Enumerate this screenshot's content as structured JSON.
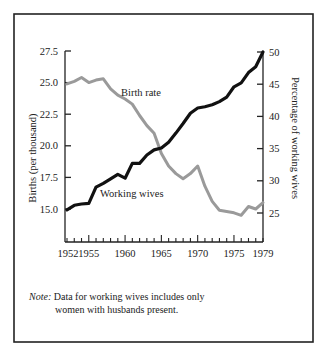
{
  "chart_data": {
    "type": "line",
    "title": "",
    "xlabel": "",
    "ylabel": "Births (per thousand)",
    "y2label": "Percentage of working wives",
    "x": [
      1952,
      1953,
      1954,
      1955,
      1956,
      1957,
      1958,
      1959,
      1960,
      1961,
      1962,
      1963,
      1964,
      1965,
      1966,
      1967,
      1968,
      1969,
      1970,
      1971,
      1972,
      1973,
      1974,
      1975,
      1976,
      1977,
      1978,
      1979
    ],
    "xlim": [
      1952,
      1979
    ],
    "ylim": [
      12.5,
      27.5
    ],
    "y2lim": [
      20,
      50
    ],
    "x_ticks": [
      1952,
      1955,
      1960,
      1965,
      1970,
      1975,
      1979
    ],
    "y_ticks": [
      "15.0",
      "17.5",
      "20.0",
      "22.5",
      "25.0",
      "27.5"
    ],
    "y2_ticks": [
      "25",
      "30",
      "35",
      "40",
      "45",
      "50"
    ],
    "grid": false,
    "series": [
      {
        "name": "Birth rate",
        "axis": "left",
        "color": "#9a9a9a",
        "values": [
          24.9,
          25.1,
          25.4,
          25.0,
          25.2,
          25.3,
          24.5,
          24.0,
          23.7,
          23.3,
          22.4,
          21.6,
          21.0,
          19.4,
          18.4,
          17.8,
          17.4,
          17.8,
          18.4,
          16.8,
          15.6,
          14.9,
          14.8,
          14.7,
          14.5,
          15.2,
          15.0,
          15.5
        ]
      },
      {
        "name": "Working wives",
        "axis": "right",
        "color": "#111111",
        "values": [
          25.5,
          26.2,
          26.4,
          26.5,
          29.0,
          29.6,
          30.3,
          31.0,
          30.4,
          32.7,
          32.7,
          34.0,
          34.8,
          35.1,
          36.0,
          37.4,
          38.9,
          40.5,
          41.3,
          41.5,
          41.8,
          42.3,
          43.0,
          44.6,
          45.2,
          46.8,
          47.7,
          50.0
        ]
      }
    ],
    "annotations": [
      "Birth rate",
      "Working wives"
    ],
    "legend": "none (inline labels)"
  },
  "note": {
    "label": "Note:",
    "line1": "Data for working wives includes only",
    "line2": "women with husbands present."
  }
}
